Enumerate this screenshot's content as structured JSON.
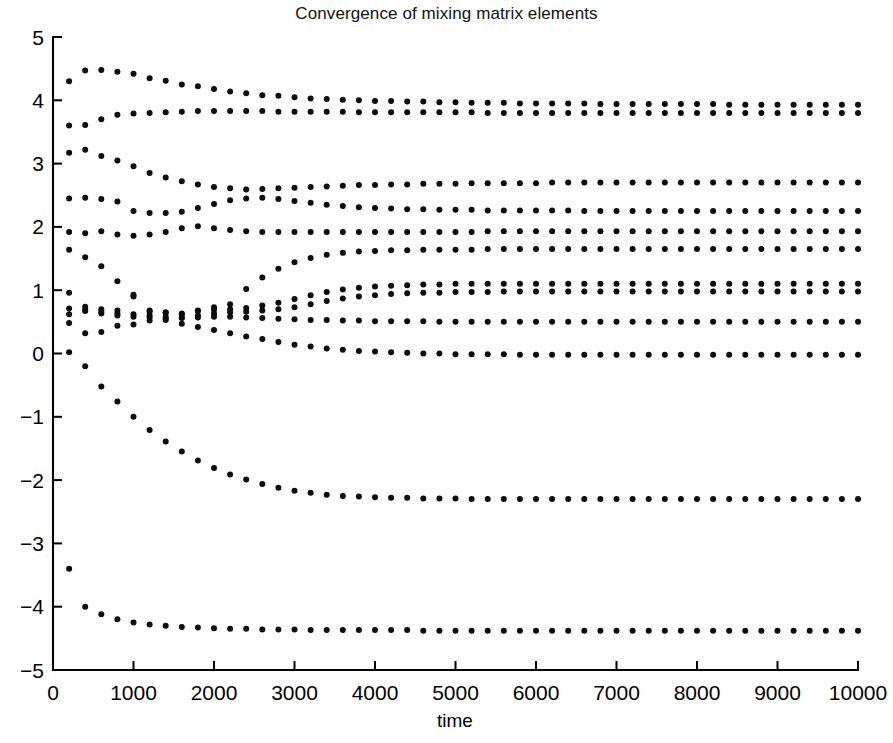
{
  "figure": {
    "title": "Convergence of mixing matrix elements",
    "background_color": "#ffffff",
    "marker_color": "#0d0d0d",
    "axis_color": "#000000"
  },
  "axes": {
    "x": {
      "label": "time",
      "min": 0,
      "max": 10000,
      "tick_step": 1000,
      "ticks": [
        0,
        1000,
        2000,
        3000,
        4000,
        5000,
        6000,
        7000,
        8000,
        9000,
        10000
      ],
      "tick_labels": [
        "0",
        "1000",
        "2000",
        "3000",
        "4000",
        "5000",
        "6000",
        "7000",
        "8000",
        "9000",
        "10000"
      ]
    },
    "y": {
      "label": "",
      "min": -5,
      "max": 5,
      "tick_step": 1,
      "ticks": [
        -5,
        -4,
        -3,
        -2,
        -1,
        0,
        1,
        2,
        3,
        4,
        5
      ],
      "tick_labels": [
        "-5",
        "-4",
        "-3",
        "-2",
        "-1",
        "0",
        "1",
        "2",
        "3",
        "4",
        "5"
      ]
    },
    "grid": false,
    "box": false,
    "legend": "none"
  },
  "chart_data": {
    "type": "scatter",
    "title": "Convergence of mixing matrix elements",
    "xlabel": "time",
    "ylabel": "",
    "xlim": [
      0,
      10000
    ],
    "ylim": [
      -5,
      5
    ],
    "grid": false,
    "legend_position": "none",
    "marker": "dot",
    "marker_size": 3,
    "sample_step": 200,
    "x": [
      200,
      400,
      600,
      800,
      1000,
      1200,
      1400,
      1600,
      1800,
      2000,
      2200,
      2400,
      2600,
      2800,
      3000,
      3200,
      3400,
      3600,
      3800,
      4000,
      4200,
      4400,
      4600,
      4800,
      5000,
      5200,
      5400,
      5600,
      5800,
      6000,
      6200,
      6400,
      6600,
      6800,
      7000,
      7200,
      7400,
      7600,
      7800,
      8000,
      8200,
      8400,
      8600,
      8800,
      9000,
      9200,
      9400,
      9600,
      9800,
      10000
    ],
    "series": [
      {
        "name": "element-1",
        "final_value": 3.93,
        "values": [
          4.3,
          4.47,
          4.48,
          4.45,
          4.42,
          4.35,
          4.31,
          4.25,
          4.22,
          4.18,
          4.14,
          4.11,
          4.08,
          4.07,
          4.05,
          4.03,
          4.02,
          4.01,
          4.0,
          3.99,
          3.99,
          3.98,
          3.98,
          3.97,
          3.97,
          3.96,
          3.96,
          3.96,
          3.95,
          3.95,
          3.95,
          3.95,
          3.95,
          3.94,
          3.94,
          3.94,
          3.94,
          3.94,
          3.94,
          3.94,
          3.94,
          3.93,
          3.93,
          3.93,
          3.93,
          3.93,
          3.93,
          3.93,
          3.93,
          3.93
        ]
      },
      {
        "name": "element-2",
        "final_value": 3.8,
        "values": [
          3.6,
          3.61,
          3.7,
          3.77,
          3.79,
          3.8,
          3.81,
          3.82,
          3.83,
          3.83,
          3.83,
          3.83,
          3.83,
          3.82,
          3.82,
          3.82,
          3.82,
          3.82,
          3.81,
          3.81,
          3.81,
          3.81,
          3.81,
          3.81,
          3.81,
          3.81,
          3.8,
          3.8,
          3.8,
          3.8,
          3.8,
          3.8,
          3.8,
          3.8,
          3.8,
          3.8,
          3.8,
          3.8,
          3.8,
          3.8,
          3.8,
          3.8,
          3.8,
          3.8,
          3.8,
          3.8,
          3.8,
          3.8,
          3.8,
          3.8
        ]
      },
      {
        "name": "element-3",
        "final_value": 2.7,
        "values": [
          3.17,
          3.22,
          3.12,
          3.05,
          2.96,
          2.85,
          2.78,
          2.72,
          2.67,
          2.63,
          2.61,
          2.59,
          2.6,
          2.61,
          2.62,
          2.63,
          2.64,
          2.65,
          2.66,
          2.66,
          2.67,
          2.67,
          2.68,
          2.68,
          2.68,
          2.69,
          2.69,
          2.69,
          2.69,
          2.69,
          2.7,
          2.7,
          2.7,
          2.7,
          2.7,
          2.7,
          2.7,
          2.7,
          2.7,
          2.7,
          2.7,
          2.7,
          2.7,
          2.7,
          2.7,
          2.7,
          2.7,
          2.7,
          2.7,
          2.7
        ]
      },
      {
        "name": "element-4",
        "final_value": 2.25,
        "values": [
          2.45,
          2.46,
          2.44,
          2.4,
          2.25,
          2.22,
          2.22,
          2.24,
          2.3,
          2.36,
          2.42,
          2.45,
          2.46,
          2.44,
          2.41,
          2.38,
          2.35,
          2.33,
          2.31,
          2.3,
          2.29,
          2.28,
          2.28,
          2.27,
          2.27,
          2.27,
          2.26,
          2.26,
          2.26,
          2.26,
          2.26,
          2.26,
          2.25,
          2.25,
          2.25,
          2.25,
          2.25,
          2.25,
          2.25,
          2.25,
          2.25,
          2.25,
          2.25,
          2.25,
          2.25,
          2.25,
          2.25,
          2.25,
          2.25,
          2.25
        ]
      },
      {
        "name": "element-5",
        "final_value": 1.93,
        "values": [
          1.92,
          1.9,
          1.93,
          1.88,
          1.86,
          1.88,
          1.92,
          1.98,
          2.01,
          1.98,
          1.95,
          1.93,
          1.92,
          1.92,
          1.92,
          1.92,
          1.92,
          1.92,
          1.92,
          1.92,
          1.92,
          1.92,
          1.92,
          1.92,
          1.92,
          1.92,
          1.93,
          1.93,
          1.93,
          1.93,
          1.93,
          1.93,
          1.93,
          1.93,
          1.93,
          1.93,
          1.93,
          1.93,
          1.93,
          1.93,
          1.93,
          1.93,
          1.93,
          1.93,
          1.93,
          1.93,
          1.93,
          1.93,
          1.93,
          1.93
        ]
      },
      {
        "name": "element-6",
        "final_value": 1.65,
        "values": [
          1.64,
          1.52,
          1.38,
          1.14,
          0.93,
          0.66,
          0.64,
          0.63,
          0.68,
          0.73,
          0.78,
          1.02,
          1.2,
          1.34,
          1.44,
          1.51,
          1.56,
          1.59,
          1.61,
          1.62,
          1.63,
          1.63,
          1.64,
          1.64,
          1.64,
          1.64,
          1.65,
          1.65,
          1.65,
          1.65,
          1.65,
          1.65,
          1.65,
          1.65,
          1.65,
          1.65,
          1.65,
          1.65,
          1.65,
          1.65,
          1.65,
          1.65,
          1.65,
          1.65,
          1.65,
          1.65,
          1.65,
          1.65,
          1.65,
          1.65
        ]
      },
      {
        "name": "element-7",
        "final_value": 1.1,
        "values": [
          0.96,
          0.74,
          0.7,
          0.68,
          0.9,
          0.68,
          0.65,
          0.62,
          0.67,
          0.69,
          0.7,
          0.72,
          0.76,
          0.8,
          0.86,
          0.92,
          0.97,
          1.01,
          1.04,
          1.06,
          1.07,
          1.08,
          1.09,
          1.09,
          1.1,
          1.1,
          1.1,
          1.1,
          1.1,
          1.1,
          1.1,
          1.1,
          1.1,
          1.1,
          1.1,
          1.1,
          1.1,
          1.1,
          1.1,
          1.1,
          1.1,
          1.1,
          1.1,
          1.1,
          1.1,
          1.1,
          1.1,
          1.1,
          1.1,
          1.1
        ]
      },
      {
        "name": "element-8",
        "final_value": 0.98,
        "values": [
          0.71,
          0.69,
          0.66,
          0.63,
          0.62,
          0.6,
          0.58,
          0.57,
          0.6,
          0.63,
          0.65,
          0.66,
          0.68,
          0.7,
          0.73,
          0.78,
          0.83,
          0.87,
          0.9,
          0.92,
          0.94,
          0.95,
          0.96,
          0.96,
          0.97,
          0.97,
          0.97,
          0.98,
          0.98,
          0.98,
          0.98,
          0.98,
          0.98,
          0.98,
          0.98,
          0.98,
          0.98,
          0.98,
          0.98,
          0.98,
          0.98,
          0.98,
          0.98,
          0.98,
          0.98,
          0.98,
          0.98,
          0.98,
          0.98,
          0.98
        ]
      },
      {
        "name": "element-9",
        "final_value": 0.5,
        "values": [
          0.62,
          0.67,
          0.63,
          0.6,
          0.58,
          0.57,
          0.55,
          0.56,
          0.57,
          0.58,
          0.58,
          0.57,
          0.56,
          0.55,
          0.54,
          0.53,
          0.53,
          0.52,
          0.52,
          0.51,
          0.51,
          0.51,
          0.51,
          0.5,
          0.5,
          0.5,
          0.5,
          0.5,
          0.5,
          0.5,
          0.5,
          0.5,
          0.5,
          0.5,
          0.5,
          0.5,
          0.5,
          0.5,
          0.5,
          0.5,
          0.5,
          0.5,
          0.5,
          0.5,
          0.5,
          0.5,
          0.5,
          0.5,
          0.5,
          0.5
        ]
      },
      {
        "name": "element-10",
        "final_value": -0.02,
        "values": [
          0.48,
          0.32,
          0.34,
          0.44,
          0.46,
          0.52,
          0.53,
          0.47,
          0.42,
          0.37,
          0.32,
          0.27,
          0.23,
          0.18,
          0.14,
          0.11,
          0.08,
          0.06,
          0.04,
          0.03,
          0.02,
          0.01,
          0.0,
          0.0,
          -0.01,
          -0.01,
          -0.01,
          -0.01,
          -0.02,
          -0.02,
          -0.02,
          -0.02,
          -0.02,
          -0.02,
          -0.02,
          -0.02,
          -0.02,
          -0.02,
          -0.02,
          -0.02,
          -0.02,
          -0.02,
          -0.02,
          -0.02,
          -0.02,
          -0.02,
          -0.02,
          -0.02,
          -0.02,
          -0.02
        ]
      },
      {
        "name": "element-11",
        "final_value": -2.3,
        "values": [
          0.02,
          -0.2,
          -0.52,
          -0.76,
          -1.0,
          -1.21,
          -1.39,
          -1.55,
          -1.69,
          -1.81,
          -1.91,
          -1.99,
          -2.06,
          -2.12,
          -2.17,
          -2.2,
          -2.23,
          -2.25,
          -2.26,
          -2.27,
          -2.28,
          -2.28,
          -2.29,
          -2.29,
          -2.29,
          -2.3,
          -2.3,
          -2.3,
          -2.3,
          -2.3,
          -2.3,
          -2.3,
          -2.3,
          -2.3,
          -2.3,
          -2.3,
          -2.3,
          -2.3,
          -2.3,
          -2.3,
          -2.3,
          -2.3,
          -2.3,
          -2.3,
          -2.3,
          -2.3,
          -2.3,
          -2.3,
          -2.3,
          -2.3
        ]
      },
      {
        "name": "element-12",
        "final_value": -4.38,
        "values": [
          -3.4,
          -4.0,
          -4.12,
          -4.2,
          -4.25,
          -4.28,
          -4.3,
          -4.32,
          -4.33,
          -4.34,
          -4.35,
          -4.35,
          -4.36,
          -4.36,
          -4.36,
          -4.37,
          -4.37,
          -4.37,
          -4.37,
          -4.37,
          -4.37,
          -4.37,
          -4.38,
          -4.38,
          -4.38,
          -4.38,
          -4.38,
          -4.38,
          -4.38,
          -4.38,
          -4.38,
          -4.38,
          -4.38,
          -4.38,
          -4.38,
          -4.38,
          -4.38,
          -4.38,
          -4.38,
          -4.38,
          -4.38,
          -4.38,
          -4.38,
          -4.38,
          -4.38,
          -4.38,
          -4.38,
          -4.38,
          -4.38,
          -4.38
        ]
      }
    ]
  }
}
